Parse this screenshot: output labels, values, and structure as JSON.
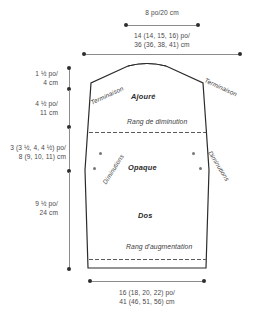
{
  "diagram": {
    "garment_piece": "Dos"
  },
  "dimensions": {
    "neck_width": {
      "imperial": "8 po/20 cm",
      "label": "8 po/20 cm"
    },
    "upper_width": {
      "line1": "14 (14, 15, 16) po/",
      "line2": "36 (36, 38, 41) cm"
    },
    "bottom_width": {
      "line1": "16 (18, 20, 22) po/",
      "line2": "41 (46, 51, 56) cm"
    },
    "shoulder_height": {
      "line1": "1 ½ po/",
      "line2": "4 cm"
    },
    "yoke_height": {
      "line1": "4 ½ po/",
      "line2": "11 cm"
    },
    "armhole_height": {
      "line1": "3 (3 ½, 4, 4 ½) po/",
      "line2": "8 (9, 10, 11) cm"
    },
    "body_height": {
      "line1": "9 ½ po/",
      "line2": "24 cm"
    }
  },
  "sections": {
    "lace": "Ajouré",
    "solid": "Opaque",
    "back": "Dos"
  },
  "rows": {
    "decrease_row": "Rang de diminution",
    "increase_row": "Rang d'augmentation"
  },
  "construction": {
    "bind_off_left": "Terminaison",
    "bind_off_right": "Terminaison",
    "decreases_left": "Diminutions",
    "decreases_right": "Diminutions"
  },
  "colors": {
    "outline": "#2b2b2b",
    "measure_line": "#8c8c8c",
    "dot": "#5a5a5a",
    "text": "#3a3a3a"
  }
}
